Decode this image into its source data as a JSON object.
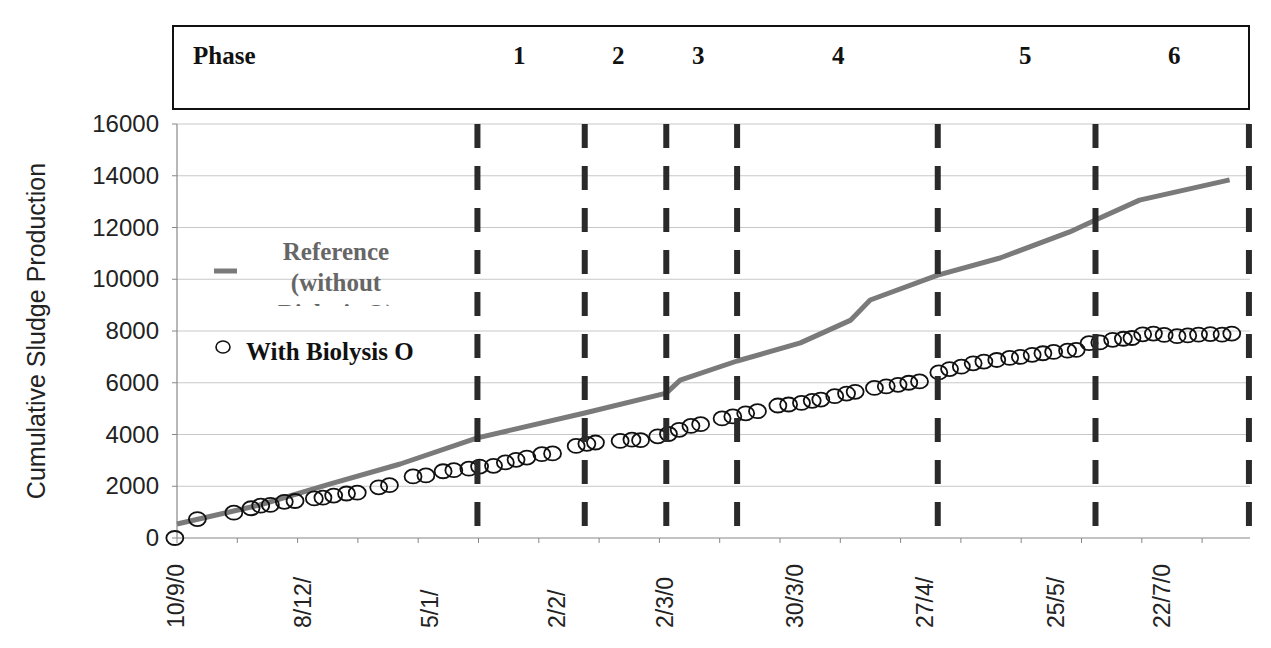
{
  "phase_header": {
    "title": "Phase",
    "phases": [
      {
        "label": "1",
        "x": 520
      },
      {
        "label": "2",
        "x": 619
      },
      {
        "label": "3",
        "x": 699
      },
      {
        "label": "4",
        "x": 839
      },
      {
        "label": "5",
        "x": 1026
      },
      {
        "label": "6",
        "x": 1175
      }
    ]
  },
  "legend": {
    "reference_label": "Reference (without Biolysis O)",
    "reference_lines": [
      "Reference",
      "(without",
      "Biolysis O)"
    ],
    "biolysis_label": "With Biolysis O"
  },
  "colors": {
    "reference_line": "#7a7a7a",
    "biolysis_marker": "#111111",
    "phase_divider": "#2a2a2a",
    "grid": "#c8c8c8",
    "axis": "#888888"
  },
  "chart_data": {
    "type": "line",
    "title": "",
    "xlabel": "",
    "ylabel": "Cumulative Sludge Production",
    "ylim": [
      0,
      16000
    ],
    "yticks": [
      0,
      2000,
      4000,
      6000,
      8000,
      10000,
      12000,
      14000,
      16000
    ],
    "xtick_labels": [
      "10/9/0",
      "8/12/",
      "5/1/",
      "2/2/",
      "2/3/0",
      "30/3/0",
      "27/4/",
      "25/5/",
      "22/7/0"
    ],
    "xtick_positions_frac": [
      0.0,
      0.118,
      0.237,
      0.355,
      0.456,
      0.577,
      0.698,
      0.82,
      0.919
    ],
    "grid": true,
    "legend_position": "upper-left inside plot",
    "phase_boundaries_frac": [
      0.28,
      0.38,
      0.456,
      0.522,
      0.709,
      0.856,
      0.999
    ],
    "x_note": "x is normalized 0..1 across the date axis (10/9/0 to end of record)",
    "series": [
      {
        "name": "Reference (without Biolysis O)",
        "style": "line",
        "points": [
          [
            0.0,
            540
          ],
          [
            0.077,
            1275
          ],
          [
            0.143,
            2090
          ],
          [
            0.208,
            2860
          ],
          [
            0.28,
            3870
          ],
          [
            0.38,
            4830
          ],
          [
            0.456,
            5600
          ],
          [
            0.469,
            6100
          ],
          [
            0.522,
            6840
          ],
          [
            0.581,
            7540
          ],
          [
            0.628,
            8420
          ],
          [
            0.646,
            9200
          ],
          [
            0.709,
            10160
          ],
          [
            0.767,
            10820
          ],
          [
            0.832,
            11830
          ],
          [
            0.856,
            12290
          ],
          [
            0.897,
            13060
          ],
          [
            0.981,
            13840
          ]
        ]
      },
      {
        "name": "With Biolysis O",
        "style": "markers",
        "points": [
          [
            -0.002,
            0
          ],
          [
            0.019,
            730
          ],
          [
            0.053,
            980
          ],
          [
            0.069,
            1150
          ],
          [
            0.078,
            1250
          ],
          [
            0.087,
            1280
          ],
          [
            0.1,
            1400
          ],
          [
            0.11,
            1430
          ],
          [
            0.128,
            1530
          ],
          [
            0.136,
            1560
          ],
          [
            0.146,
            1640
          ],
          [
            0.158,
            1720
          ],
          [
            0.168,
            1750
          ],
          [
            0.188,
            1960
          ],
          [
            0.198,
            2040
          ],
          [
            0.22,
            2380
          ],
          [
            0.232,
            2420
          ],
          [
            0.248,
            2580
          ],
          [
            0.258,
            2620
          ],
          [
            0.272,
            2680
          ],
          [
            0.282,
            2760
          ],
          [
            0.295,
            2790
          ],
          [
            0.306,
            2920
          ],
          [
            0.316,
            3020
          ],
          [
            0.326,
            3110
          ],
          [
            0.34,
            3240
          ],
          [
            0.35,
            3270
          ],
          [
            0.372,
            3560
          ],
          [
            0.382,
            3640
          ],
          [
            0.39,
            3690
          ],
          [
            0.413,
            3750
          ],
          [
            0.424,
            3800
          ],
          [
            0.432,
            3780
          ],
          [
            0.448,
            3930
          ],
          [
            0.458,
            4020
          ],
          [
            0.468,
            4180
          ],
          [
            0.479,
            4330
          ],
          [
            0.488,
            4400
          ],
          [
            0.508,
            4620
          ],
          [
            0.518,
            4700
          ],
          [
            0.53,
            4820
          ],
          [
            0.541,
            4900
          ],
          [
            0.56,
            5120
          ],
          [
            0.57,
            5160
          ],
          [
            0.582,
            5220
          ],
          [
            0.592,
            5300
          ],
          [
            0.6,
            5350
          ],
          [
            0.613,
            5480
          ],
          [
            0.624,
            5580
          ],
          [
            0.632,
            5650
          ],
          [
            0.65,
            5800
          ],
          [
            0.661,
            5860
          ],
          [
            0.672,
            5920
          ],
          [
            0.682,
            6000
          ],
          [
            0.692,
            6050
          ],
          [
            0.71,
            6400
          ],
          [
            0.72,
            6530
          ],
          [
            0.731,
            6620
          ],
          [
            0.742,
            6750
          ],
          [
            0.752,
            6820
          ],
          [
            0.764,
            6880
          ],
          [
            0.776,
            6960
          ],
          [
            0.786,
            7000
          ],
          [
            0.797,
            7080
          ],
          [
            0.807,
            7140
          ],
          [
            0.817,
            7190
          ],
          [
            0.83,
            7240
          ],
          [
            0.838,
            7270
          ],
          [
            0.85,
            7530
          ],
          [
            0.86,
            7560
          ],
          [
            0.872,
            7660
          ],
          [
            0.882,
            7700
          ],
          [
            0.89,
            7730
          ],
          [
            0.9,
            7870
          ],
          [
            0.91,
            7900
          ],
          [
            0.92,
            7850
          ],
          [
            0.932,
            7800
          ],
          [
            0.942,
            7830
          ],
          [
            0.952,
            7860
          ],
          [
            0.963,
            7880
          ],
          [
            0.974,
            7860
          ],
          [
            0.983,
            7900
          ]
        ]
      }
    ]
  }
}
